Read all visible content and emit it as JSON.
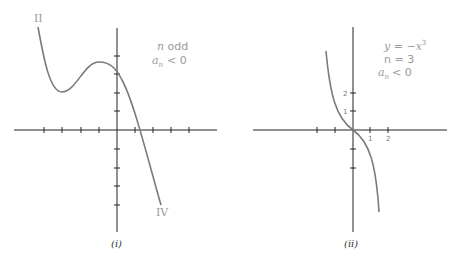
{
  "panels": [
    {
      "id": "i",
      "caption": "(i)",
      "annotation_line1": "n odd",
      "annotation_line2_lhs": "a",
      "annotation_line2_sub": "n",
      "annotation_line2_rhs": "< 0",
      "left_end_label": "II",
      "right_end_label": "IV"
    },
    {
      "id": "ii",
      "caption": "(ii)",
      "equation": "y = −x",
      "equation_exp": "3",
      "degree": "n = 3",
      "coef_lhs": "a",
      "coef_sub": "n",
      "coef_rhs": "< 0",
      "x_tick_labels": [
        "1",
        "2"
      ],
      "y_tick_labels": [
        "2",
        "1"
      ]
    }
  ],
  "colors": {
    "curve": "#7a7a7a",
    "axis": "#222222",
    "label": "#9a9a9a"
  }
}
